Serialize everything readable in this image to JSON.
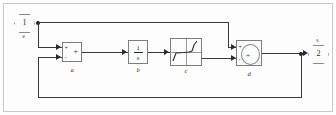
{
  "diagram": {
    "style": "simulink",
    "line_color": "#3a3a3a",
    "block_border_color": "#7d7d7d",
    "block_fill_color": "#fcfcfc",
    "ports": [
      {
        "id": "in1",
        "kind": "inport",
        "number": "1",
        "label": "e"
      },
      {
        "id": "out1",
        "kind": "outport",
        "number": "2",
        "label": "s"
      }
    ],
    "blocks": [
      {
        "id": "a",
        "name": "a",
        "kind": "sum",
        "glyph": "+",
        "input_signs": [
          "+",
          "-"
        ]
      },
      {
        "id": "b",
        "name": "b",
        "kind": "transfer-function",
        "numerator": "1",
        "denominator": "s"
      },
      {
        "id": "c",
        "name": "c",
        "kind": "nonlinearity",
        "glyph": "saturation-curve"
      },
      {
        "id": "d",
        "name": "d",
        "kind": "sum-round",
        "glyph": "+",
        "input_signs": [
          "+",
          "-"
        ]
      }
    ],
    "icons": {
      "junction": "signal-branch-dot",
      "arrow": "signal-arrow-icon"
    }
  }
}
